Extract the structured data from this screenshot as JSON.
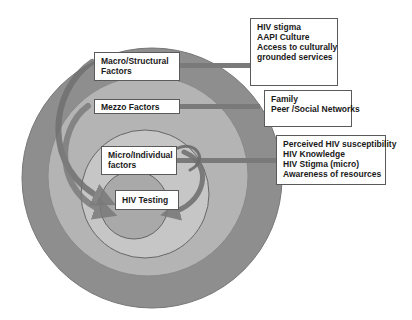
{
  "diagram": {
    "type": "nested-circles",
    "colors": {
      "outer_ring": "#8c8c8c",
      "mezzo_ring": "#b5b5b5",
      "micro_ring": "#c8c8c8",
      "core": "#a6a6a6",
      "arrow": "#6f6f6f",
      "box_border": "#5a5a5a"
    },
    "levels": [
      {
        "id": "macro",
        "label_lines": [
          "Macro/Structural",
          "Factors"
        ]
      },
      {
        "id": "mezzo",
        "label_lines": [
          "Mezzo Factors"
        ]
      },
      {
        "id": "micro",
        "label_lines": [
          "Micro/Individual",
          "factors"
        ]
      },
      {
        "id": "core",
        "label_lines": [
          "HIV Testing"
        ]
      }
    ],
    "factor_boxes": [
      {
        "level": "macro",
        "items": [
          "HIV stigma",
          "AAPI Culture",
          "Access to culturally",
          "grounded services"
        ]
      },
      {
        "level": "mezzo",
        "items": [
          "Family",
          "Peer /Social Networks"
        ]
      },
      {
        "level": "micro",
        "items": [
          "Perceived HIV susceptibility",
          "HIV Knowledge",
          "HIV Stigma (micro)",
          "Awareness of resources"
        ]
      }
    ]
  }
}
